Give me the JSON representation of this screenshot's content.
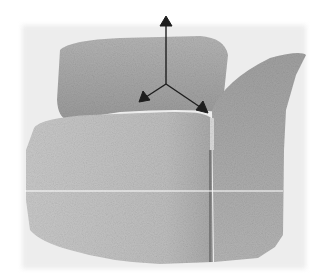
{
  "image": {
    "subject": "armchair point-cloud scan",
    "render_style": "grayscale",
    "elements": {
      "axes_triad": {
        "label": "coordinate axes",
        "color": "#1e1e1e"
      },
      "scan_line": {
        "label": "horizontal scan line",
        "color": "#ffffff"
      },
      "colors": {
        "background": "#ffffff",
        "cloud_halo": "#ececec",
        "back_cushion": "#a4a4a4",
        "seat": "#c4c4c4",
        "seat_front": "#b6b6b6",
        "armrest": "#ababab",
        "seam": "#7d7d7d"
      }
    }
  }
}
